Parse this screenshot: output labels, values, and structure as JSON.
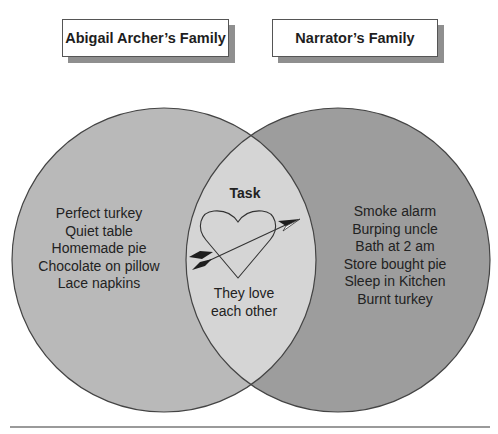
{
  "labels": {
    "left_set": "Abigail Archer’s Family",
    "right_set": "Narrator’s Family"
  },
  "colors": {
    "left_fill": "#b9b9b9",
    "right_fill": "#9d9d9d",
    "intersection_fill": "#d5d5d5",
    "outline": "#444444"
  },
  "left_only": {
    "items": [
      "Perfect turkey",
      "Quiet table",
      "Homemade pie",
      "Chocolate on pillow",
      "Lace napkins"
    ]
  },
  "intersection": {
    "title": "Task",
    "icon": "heart-with-arrow-icon",
    "items": [
      "They love",
      "each other"
    ]
  },
  "right_only": {
    "items": [
      "Smoke alarm",
      "Burping uncle",
      "Bath at 2 am",
      "Store bought pie",
      "Sleep in Kitchen",
      "Burnt turkey"
    ]
  }
}
